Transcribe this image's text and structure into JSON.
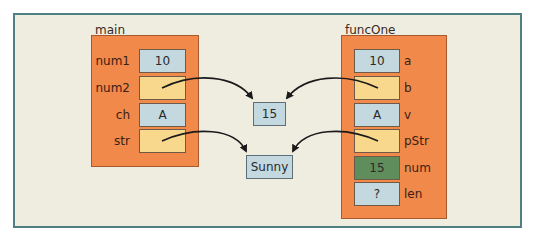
{
  "diagram": {
    "colors": {
      "background": "#efece0",
      "frame_border": "#4f7f83",
      "panel_fill": "#f0894a",
      "value_fill": "#c4d8df",
      "pointer_fill": "#f7d88c",
      "highlight_fill": "#5f8e5c",
      "arrow": "#1a1a1a"
    },
    "main": {
      "label": "main",
      "vars": [
        {
          "name": "num1",
          "value": "10",
          "kind": "value"
        },
        {
          "name": "num2",
          "value": "",
          "kind": "pointer"
        },
        {
          "name": "ch",
          "value": "A",
          "kind": "value"
        },
        {
          "name": "str",
          "value": "",
          "kind": "pointer"
        }
      ]
    },
    "funcOne": {
      "label": "funcOne",
      "vars": [
        {
          "name": "a",
          "value": "10",
          "kind": "value"
        },
        {
          "name": "b",
          "value": "",
          "kind": "pointer"
        },
        {
          "name": "v",
          "value": "A",
          "kind": "value"
        },
        {
          "name": "pStr",
          "value": "",
          "kind": "pointer"
        },
        {
          "name": "num",
          "value": "15",
          "kind": "highlight"
        },
        {
          "name": "len",
          "value": "?",
          "kind": "value"
        }
      ]
    },
    "shared": {
      "int_value": "15",
      "string_value": "Sunny"
    },
    "arrows": [
      {
        "from": "main.num2",
        "to": "shared.int_value"
      },
      {
        "from": "funcOne.b",
        "to": "shared.int_value"
      },
      {
        "from": "main.str",
        "to": "shared.string_value"
      },
      {
        "from": "funcOne.pStr",
        "to": "shared.string_value"
      }
    ]
  }
}
